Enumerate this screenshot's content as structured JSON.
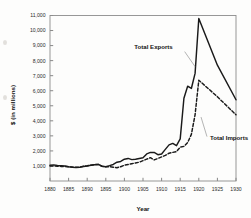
{
  "chart_data": {
    "type": "line",
    "title": "",
    "xlabel": "Year",
    "ylabel": "$ (in millions)",
    "xlim": [
      1880,
      1930
    ],
    "ylim": [
      0,
      11000
    ],
    "grid": false,
    "legend_position": "inline-annotations",
    "xticks": [
      "1880",
      "1885",
      "1890",
      "1895",
      "1900",
      "1905",
      "1910",
      "1915",
      "1920",
      "1925",
      "1930"
    ],
    "xtick_values": [
      1880,
      1885,
      1890,
      1895,
      1900,
      1905,
      1910,
      1915,
      1920,
      1925,
      1930
    ],
    "yticks": [
      "1,000",
      "2,000",
      "3,000",
      "4,000",
      "5,000",
      "6,000",
      "7,000",
      "8,000",
      "9,000",
      "10,000",
      "11,000"
    ],
    "ytick_values": [
      1000,
      2000,
      3000,
      4000,
      5000,
      6000,
      7000,
      8000,
      9000,
      10000,
      11000
    ],
    "series": [
      {
        "name": "Total Exports",
        "style": "solid",
        "color": "#1a1a1a",
        "x": [
          1880,
          1881,
          1882,
          1883,
          1884,
          1885,
          1886,
          1887,
          1888,
          1889,
          1890,
          1891,
          1892,
          1893,
          1894,
          1895,
          1896,
          1897,
          1898,
          1899,
          1900,
          1901,
          1902,
          1903,
          1904,
          1905,
          1906,
          1907,
          1908,
          1909,
          1910,
          1911,
          1912,
          1913,
          1914,
          1915,
          1916,
          1917,
          1918,
          1919,
          1920,
          1925,
          1930
        ],
        "values": [
          1050,
          1070,
          1030,
          1020,
          1000,
          950,
          920,
          900,
          910,
          960,
          1000,
          1050,
          1080,
          1100,
          980,
          950,
          1020,
          1100,
          1250,
          1300,
          1450,
          1500,
          1420,
          1450,
          1500,
          1550,
          1800,
          1900,
          1900,
          1750,
          1800,
          2100,
          2400,
          2500,
          2350,
          2800,
          5500,
          6300,
          6150,
          7150,
          10800,
          7700,
          5400
        ]
      },
      {
        "name": "Total Imports",
        "style": "dashed",
        "color": "#1a1a1a",
        "x": [
          1880,
          1881,
          1882,
          1883,
          1884,
          1885,
          1886,
          1887,
          1888,
          1889,
          1890,
          1891,
          1892,
          1893,
          1894,
          1895,
          1896,
          1897,
          1898,
          1899,
          1900,
          1901,
          1902,
          1903,
          1904,
          1905,
          1906,
          1907,
          1908,
          1909,
          1910,
          1911,
          1912,
          1913,
          1914,
          1915,
          1916,
          1917,
          1918,
          1919,
          1920,
          1925,
          1930
        ],
        "values": [
          1000,
          1000,
          980,
          970,
          960,
          950,
          930,
          910,
          930,
          980,
          1010,
          1050,
          1090,
          1100,
          980,
          940,
          950,
          920,
          880,
          950,
          1050,
          1100,
          1150,
          1200,
          1250,
          1350,
          1450,
          1550,
          1400,
          1500,
          1600,
          1700,
          1850,
          1900,
          1950,
          2250,
          2300,
          2550,
          3100,
          4400,
          6700,
          5600,
          4400
        ]
      }
    ],
    "annotations": [
      {
        "text": "Total Exports",
        "x": 1913,
        "y": 8800
      },
      {
        "text": "Total Imports",
        "x": 1923,
        "y": 2700
      }
    ]
  },
  "axes": {
    "x_title": "Year",
    "y_title": "$ (in millions)"
  }
}
